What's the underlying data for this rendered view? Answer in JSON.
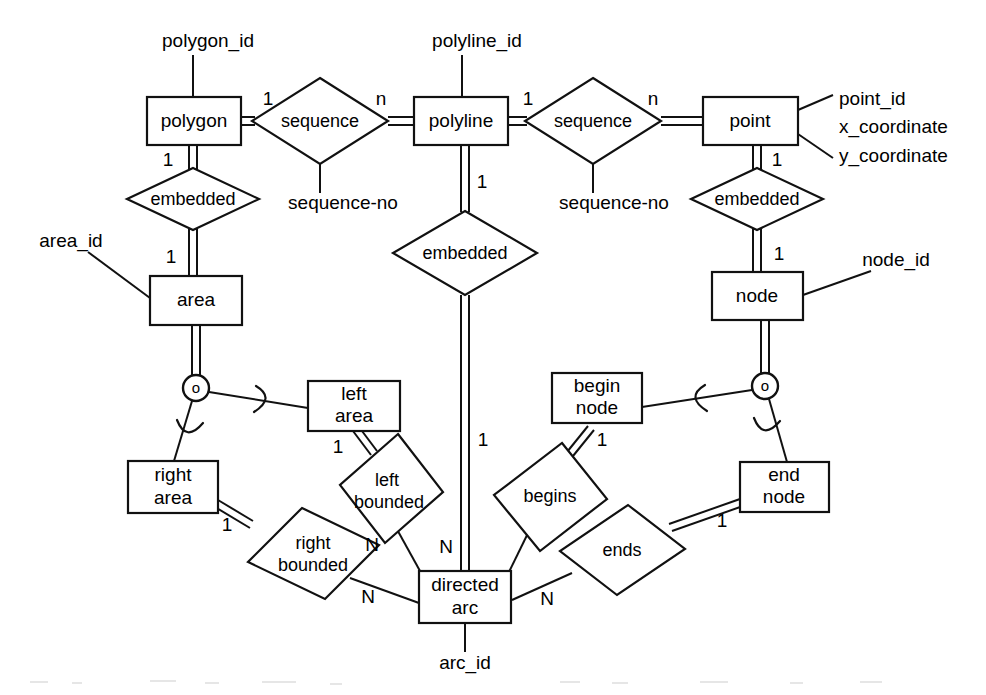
{
  "diagram": {
    "type": "entity-relationship-diagram",
    "title": "",
    "stroke_color": "#111111",
    "background_color": "#ffffff",
    "entities": [
      {
        "id": "polygon",
        "label": "polygon",
        "x": 193,
        "y": 121,
        "w": 94,
        "h": 48
      },
      {
        "id": "polyline",
        "label": "polyline",
        "x": 460,
        "y": 121,
        "w": 94,
        "h": 48
      },
      {
        "id": "point",
        "label": "point",
        "x": 750,
        "y": 121,
        "w": 95,
        "h": 48
      },
      {
        "id": "area",
        "label": "area",
        "x": 196,
        "y": 300,
        "w": 92,
        "h": 49
      },
      {
        "id": "node",
        "label": "node",
        "x": 757,
        "y": 296,
        "w": 91,
        "h": 48
      },
      {
        "id": "left_area",
        "label": "left\narea",
        "x": 354,
        "y": 406,
        "w": 92,
        "h": 50
      },
      {
        "id": "right_area",
        "label": "right\narea",
        "x": 173,
        "y": 487,
        "w": 90,
        "h": 52
      },
      {
        "id": "begin_node",
        "label": "begin\nnode",
        "x": 597,
        "y": 398,
        "w": 90,
        "h": 50
      },
      {
        "id": "end_node",
        "label": "end\nnode",
        "x": 784,
        "y": 487,
        "w": 89,
        "h": 50
      },
      {
        "id": "directed_arc",
        "label": "directed\narc",
        "x": 465,
        "y": 597,
        "w": 92,
        "h": 52
      }
    ],
    "relationships": [
      {
        "id": "sequence_1",
        "label": "sequence",
        "x": 320,
        "y": 121,
        "rx": 68,
        "ry": 43
      },
      {
        "id": "sequence_2",
        "label": "sequence",
        "x": 593,
        "y": 121,
        "rx": 68,
        "ry": 43
      },
      {
        "id": "embedded_left",
        "label": "embedded",
        "x": 193,
        "y": 199,
        "rx": 66,
        "ry": 32
      },
      {
        "id": "embedded_mid",
        "label": "embedded",
        "x": 465,
        "y": 253,
        "rx": 72,
        "ry": 42
      },
      {
        "id": "embedded_right",
        "label": "embedded",
        "x": 757,
        "y": 199,
        "rx": 66,
        "ry": 32
      },
      {
        "id": "left_bounded",
        "label": "left\nbounded",
        "x": 377,
        "y": 489,
        "rx": 53,
        "ry": 47,
        "rotated": true
      },
      {
        "id": "right_bounded",
        "label": "right\nbounded",
        "x": 313,
        "y": 553,
        "rx": 66,
        "ry": 45
      },
      {
        "id": "begins",
        "label": "begins",
        "x": 548,
        "y": 494,
        "rx": 59,
        "ry": 45,
        "rotated": true
      },
      {
        "id": "ends",
        "label": "ends",
        "x": 622,
        "y": 550,
        "rx": 63,
        "ry": 44
      }
    ],
    "attributes": [
      {
        "id": "polygon_id",
        "label": "polygon_id",
        "x": 208,
        "y": 42,
        "anchor": "middle"
      },
      {
        "id": "polyline_id",
        "label": "polyline_id",
        "x": 477,
        "y": 42,
        "anchor": "middle"
      },
      {
        "id": "point_id",
        "label": "point_id",
        "x": 839,
        "y": 100,
        "anchor": "start"
      },
      {
        "id": "x_coordinate",
        "label": "x_coordinate",
        "x": 839,
        "y": 127,
        "anchor": "start"
      },
      {
        "id": "y_coordinate",
        "label": "y_coordinate",
        "x": 839,
        "y": 156,
        "anchor": "start"
      },
      {
        "id": "sequence_no_1",
        "label": "sequence-no",
        "x": 343,
        "y": 203,
        "anchor": "middle"
      },
      {
        "id": "sequence_no_2",
        "label": "sequence-no",
        "x": 614,
        "y": 203,
        "anchor": "middle"
      },
      {
        "id": "area_id",
        "label": "area_id",
        "x": 71,
        "y": 242,
        "anchor": "middle"
      },
      {
        "id": "node_id",
        "label": "node_id",
        "x": 896,
        "y": 261,
        "anchor": "middle"
      },
      {
        "id": "arc_id",
        "label": "arc_id",
        "x": 465,
        "y": 663,
        "anchor": "middle"
      }
    ],
    "cardinalities": [
      {
        "id": "card_polygon_sequence",
        "label": "1",
        "x": 268,
        "y": 100
      },
      {
        "id": "card_sequence_polyline",
        "label": "n",
        "x": 381,
        "y": 100
      },
      {
        "id": "card_polyline_sequence",
        "label": "1",
        "x": 528,
        "y": 100
      },
      {
        "id": "card_sequence_point",
        "label": "n",
        "x": 653,
        "y": 100
      },
      {
        "id": "card_polygon_embedded",
        "label": "1",
        "x": 168,
        "y": 160
      },
      {
        "id": "card_point_embedded",
        "label": "1",
        "x": 777,
        "y": 160
      },
      {
        "id": "card_polyline_embedded",
        "label": "1",
        "x": 482,
        "y": 182
      },
      {
        "id": "card_embedded_area",
        "label": "1",
        "x": 171,
        "y": 257
      },
      {
        "id": "card_embedded_node",
        "label": "1",
        "x": 779,
        "y": 254
      },
      {
        "id": "card_embedded_directedarc",
        "label": "1",
        "x": 483,
        "y": 440
      },
      {
        "id": "card_leftarea_bounded",
        "label": "1",
        "x": 338,
        "y": 447
      },
      {
        "id": "card_beginnode_begins",
        "label": "1",
        "x": 602,
        "y": 440
      },
      {
        "id": "card_rightarea_bounded",
        "label": "1",
        "x": 227,
        "y": 525
      },
      {
        "id": "card_endnode_ends",
        "label": "1",
        "x": 722,
        "y": 521
      },
      {
        "id": "card_leftbounded_arc",
        "label": "N",
        "x": 372,
        "y": 545
      },
      {
        "id": "card_begins_arc",
        "label": "N",
        "x": 446,
        "y": 547
      },
      {
        "id": "card_rightbounded_arc",
        "label": "N",
        "x": 368,
        "y": 597
      },
      {
        "id": "card_ends_arc",
        "label": "N",
        "x": 547,
        "y": 599
      }
    ],
    "symbols": [
      {
        "id": "subtype_circle_left",
        "label": "o",
        "x": 196,
        "y": 388,
        "r": 13
      },
      {
        "id": "subtype_circle_right",
        "label": "o",
        "x": 765,
        "y": 386,
        "r": 13
      }
    ]
  }
}
